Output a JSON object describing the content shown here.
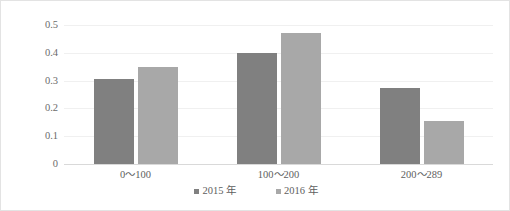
{
  "chart_data": {
    "type": "bar",
    "title": "",
    "subtitle": "",
    "xlabel": "",
    "ylabel": "",
    "grid": true,
    "legend_position": "bottom-center",
    "categories": [
      "0～100",
      "100～200",
      "200～289"
    ],
    "ylim": [
      0,
      0.5
    ],
    "ytick_labels": [
      "0.5",
      "0.4",
      "0.3",
      "0.2",
      "0.1",
      "0"
    ],
    "ytick_values": [
      0.5,
      0.4,
      0.3,
      0.2,
      0.1,
      0
    ],
    "series": [
      {
        "name": "2015 年",
        "color": "#808080",
        "values": [
          0.305,
          0.4,
          0.275
        ]
      },
      {
        "name": "2016 年",
        "color": "#a8a8a8",
        "values": [
          0.35,
          0.47,
          0.155
        ]
      }
    ]
  },
  "colors": {
    "series_2015": "#808080",
    "series_2016": "#a8a8a8",
    "gridline": "#f0f0f0",
    "axis": "#d9d9d9",
    "border": "#e3e3e3",
    "text": "#5e5e5e"
  }
}
